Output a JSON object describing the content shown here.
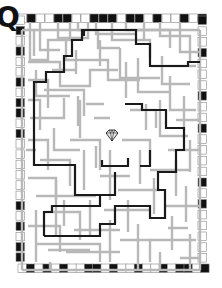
{
  "puzzle": {
    "type": "maze",
    "corner_glyph": "Q",
    "center_icon": "diamond-icon",
    "colors": {
      "background": "#ffffff",
      "wall": "#b8b8b8",
      "path": "#1a1a1a",
      "frame_dark": "#111111",
      "frame_light": "#ffffff"
    },
    "frame": {
      "top": [
        0,
        1,
        0,
        0,
        1,
        1,
        0,
        0,
        1,
        1,
        1,
        0,
        1,
        1,
        0,
        1,
        0,
        0,
        1,
        0,
        1
      ],
      "bottom": [
        0,
        1,
        0,
        1,
        0,
        1,
        0,
        0,
        1,
        1,
        0,
        1,
        0,
        0,
        1,
        0,
        0,
        1,
        0,
        1,
        1,
        0,
        1
      ],
      "left": [
        0,
        1,
        0,
        1,
        0,
        0,
        1,
        0,
        1,
        1,
        0,
        1,
        0,
        0,
        0,
        0,
        0,
        0,
        1,
        0,
        1,
        0,
        1,
        1
      ],
      "right": [
        1,
        0,
        0,
        1,
        0,
        0,
        0,
        1,
        0,
        0,
        1,
        0,
        0,
        0,
        0,
        1,
        0,
        1,
        0,
        0,
        0,
        0,
        0
      ]
    }
  }
}
